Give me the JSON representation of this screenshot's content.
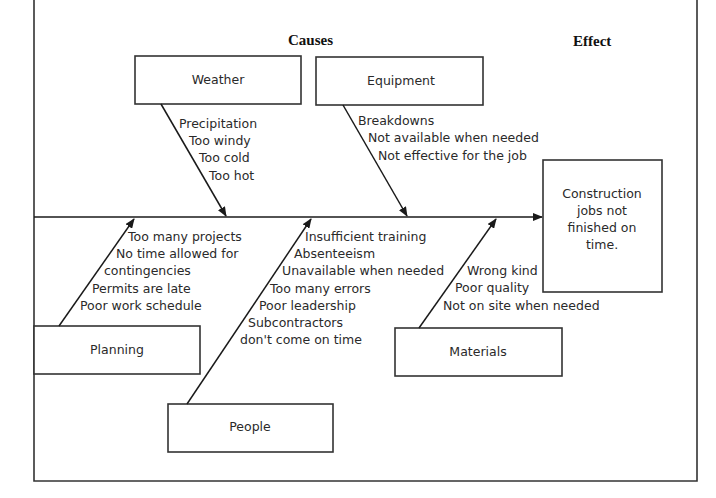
{
  "diagram": {
    "type": "fishbone",
    "headers": {
      "causes": "Causes",
      "effect": "Effect"
    },
    "effect": {
      "lines": [
        "Construction",
        "jobs not",
        "finished on",
        "time."
      ]
    },
    "categories": [
      {
        "name": "Weather",
        "position": "top",
        "causes": [
          "Precipitation",
          "Too windy",
          "Too cold",
          "Too hot"
        ]
      },
      {
        "name": "Equipment",
        "position": "top",
        "causes": [
          "Breakdowns",
          "Not available when needed",
          "Not effective for the job"
        ]
      },
      {
        "name": "Planning",
        "position": "bottom",
        "causes": [
          "Too many projects",
          "No time allowed for",
          "contingencies",
          "Permits are late",
          "Poor work schedule"
        ]
      },
      {
        "name": "People",
        "position": "bottom",
        "causes": [
          "Insufficient training",
          "Absenteeism",
          "Unavailable when needed",
          "Too many errors",
          "Poor leadership",
          "Subcontractors",
          "don't come on time"
        ]
      },
      {
        "name": "Materials",
        "position": "bottom",
        "causes": [
          "Wrong kind",
          "Poor quality",
          "Not on site when needed"
        ]
      }
    ]
  }
}
